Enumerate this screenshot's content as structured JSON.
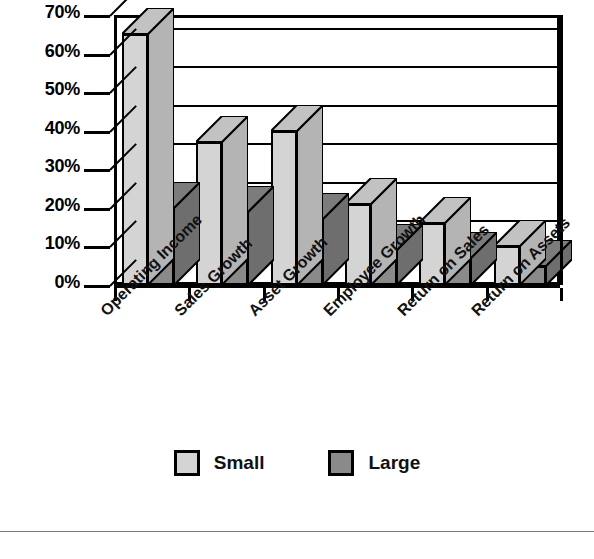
{
  "chart_data": {
    "type": "bar",
    "title": "",
    "subtitle": "",
    "xlabel": "",
    "ylabel": "",
    "categories": [
      "Operating Income",
      "Sales Growth",
      "Asset Growth",
      "Employee Growth",
      "Return on Sales",
      "Return on Assets"
    ],
    "series": [
      {
        "name": "Small",
        "values": [
          65,
          37,
          40,
          21,
          16,
          10
        ],
        "color": "#d4d4d4"
      },
      {
        "name": "Large",
        "values": [
          20,
          19,
          17,
          9,
          7,
          5
        ],
        "color": "#8a8a8a"
      }
    ],
    "y_ticks": [
      "0%",
      "10%",
      "20%",
      "30%",
      "40%",
      "50%",
      "60%",
      "70%"
    ],
    "y_tick_values": [
      0,
      10,
      20,
      30,
      40,
      50,
      60,
      70
    ],
    "ylim": [
      0,
      70
    ],
    "grid": true,
    "grid_axis": "y",
    "legend": [
      "Small",
      "Large"
    ],
    "legend_position": "bottom",
    "value_suffix": "%",
    "style": "3d-clustered-column",
    "bar_colors": {
      "small": "#d4d4d4",
      "large": "#8a8a8a"
    },
    "outline_color": "#000000",
    "background": "#ffffff"
  },
  "legend": {
    "items": [
      {
        "label": "Small",
        "swatch": "#d4d4d4",
        "swatch_name": "legend-swatch-small"
      },
      {
        "label": "Large",
        "swatch": "#8a8a8a",
        "swatch_name": "legend-swatch-large"
      }
    ]
  }
}
